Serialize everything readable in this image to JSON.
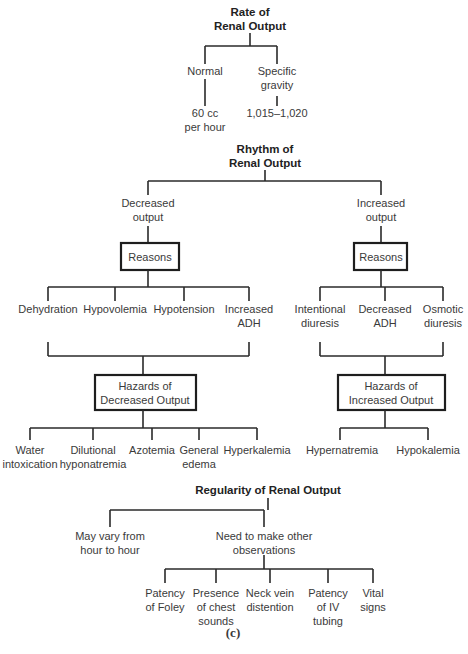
{
  "figure_label": "(c)",
  "rate": {
    "title_line1": "Rate of",
    "title_line2": "Renal Output",
    "normal": {
      "label": "Normal",
      "value_line1": "60 cc",
      "value_line2": "per hour"
    },
    "specific_gravity": {
      "label_line1": "Specific",
      "label_line2": "gravity",
      "value": "1,015–1,020"
    }
  },
  "rhythm": {
    "title_line1": "Rhythm of",
    "title_line2": "Renal Output",
    "decreased": {
      "label_line1": "Decreased",
      "label_line2": "output",
      "reasons_box": "Reasons",
      "reasons": [
        {
          "line1": "Dehydration",
          "line2": ""
        },
        {
          "line1": "Hypovolemia",
          "line2": ""
        },
        {
          "line1": "Hypotension",
          "line2": ""
        },
        {
          "line1": "Increased",
          "line2": "ADH"
        }
      ],
      "hazards_box_line1": "Hazards of",
      "hazards_box_line2": "Decreased Output",
      "hazards": [
        {
          "line1": "Water",
          "line2": "intoxication"
        },
        {
          "line1": "Dilutional",
          "line2": "hyponatremia"
        },
        {
          "line1": "Azotemia",
          "line2": ""
        },
        {
          "line1": "General",
          "line2": "edema"
        },
        {
          "line1": "Hyperkalemia",
          "line2": ""
        }
      ]
    },
    "increased": {
      "label_line1": "Increased",
      "label_line2": "output",
      "reasons_box": "Reasons",
      "reasons": [
        {
          "line1": "Intentional",
          "line2": "diuresis"
        },
        {
          "line1": "Decreased",
          "line2": "ADH"
        },
        {
          "line1": "Osmotic",
          "line2": "diuresis"
        }
      ],
      "hazards_box_line1": "Hazards of",
      "hazards_box_line2": "Increased Output",
      "hazards": [
        {
          "line1": "Hypernatremia",
          "line2": ""
        },
        {
          "line1": "Hypokalemia",
          "line2": ""
        }
      ]
    }
  },
  "regularity": {
    "title": "Regularity of Renal Output",
    "may_vary": {
      "line1": "May vary from",
      "line2": "hour to hour"
    },
    "observations": {
      "line1": "Need to make other",
      "line2": "observations",
      "items": [
        {
          "line1": "Patency",
          "line2": "of Foley",
          "line3": ""
        },
        {
          "line1": "Presence",
          "line2": "of chest",
          "line3": "sounds"
        },
        {
          "line1": "Neck vein",
          "line2": "distention",
          "line3": ""
        },
        {
          "line1": "Patency",
          "line2": "of IV",
          "line3": "tubing"
        },
        {
          "line1": "Vital",
          "line2": "signs",
          "line3": ""
        }
      ]
    }
  }
}
